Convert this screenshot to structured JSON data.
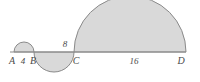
{
  "figure": {
    "background_color": "#ffffff",
    "stroke_color": "#8a8a8a",
    "fill_color": "#d9d9d9",
    "text_color": "#4a4a4a",
    "baseline": {
      "y": 52,
      "x_start": 10,
      "x_end": 186
    },
    "points": [
      {
        "id": "A",
        "label": "A",
        "x": 14,
        "y": 52,
        "label_x": 12,
        "label_y": 64
      },
      {
        "id": "B",
        "label": "B",
        "x": 34,
        "y": 52,
        "label_x": 33,
        "label_y": 64
      },
      {
        "id": "C",
        "label": "C",
        "x": 74,
        "y": 52,
        "label_x": 75,
        "label_y": 64
      },
      {
        "id": "D",
        "label": "D",
        "x": 186,
        "y": 52,
        "label_x": 180,
        "label_y": 64
      }
    ],
    "lengths": [
      {
        "id": "AB",
        "label": "4",
        "from": "A",
        "to": "B",
        "value": 4,
        "x": 23,
        "y": 64,
        "position": "below"
      },
      {
        "id": "BC",
        "label": "8",
        "from": "B",
        "to": "C",
        "value": 8,
        "x": 64,
        "y": 46,
        "position": "above"
      },
      {
        "id": "CD",
        "label": "16",
        "from": "C",
        "to": "D",
        "value": 16,
        "x": 134,
        "y": 64,
        "position": "below"
      }
    ],
    "semicircles": [
      {
        "id": "semicircle-AB",
        "from": "A",
        "to": "B",
        "cx": 24,
        "cy": 52,
        "r": 10,
        "orientation": "up",
        "diameter": 4
      },
      {
        "id": "semicircle-BC",
        "from": "B",
        "to": "C",
        "cx": 54,
        "cy": 52,
        "r": 20,
        "orientation": "down",
        "diameter": 8
      },
      {
        "id": "semicircle-CD",
        "from": "C",
        "to": "D",
        "cx": 130,
        "cy": 52,
        "r": 56,
        "orientation": "up",
        "diameter": 16
      }
    ]
  }
}
